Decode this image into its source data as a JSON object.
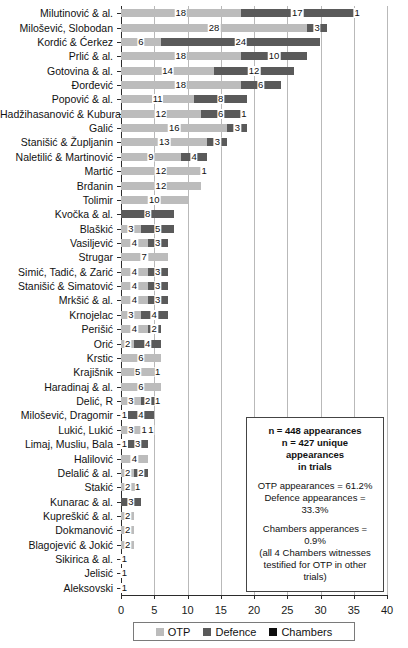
{
  "chart_data": {
    "type": "bar",
    "orientation": "horizontal",
    "stacked": true,
    "title": "",
    "xlabel": "",
    "ylabel": "",
    "xlim": [
      0,
      40
    ],
    "xticks": [
      0,
      5,
      10,
      15,
      20,
      25,
      30,
      35,
      40
    ],
    "grid": "vertical",
    "legend_position": "bottom",
    "series": [
      {
        "name": "OTP",
        "color": "#bcbcbc"
      },
      {
        "name": "Defence",
        "color": "#5a5a5a"
      },
      {
        "name": "Chambers",
        "color": "#0d0d0d"
      }
    ],
    "categories": [
      "Milutinović & al.",
      "Milošević, Slobodan",
      "Kordić & Ćerkez",
      "Prlić & al.",
      "Gotovina & al.",
      "Đorđević",
      "Popović & al.",
      "Hadžihasanović & Kubura",
      "Galić",
      "Stanišić & Župljanin",
      "Naletilić & Martinović",
      "Martić",
      "Brđanin",
      "Tolimir",
      "Kvočka & al.",
      "Blaškić",
      "Vasiljević",
      "Strugar",
      "Simić, Tadić, & Zarić",
      "Stanišić & Simatović",
      "Mrkšić & al.",
      "Krnojelac",
      "Perišić",
      "Orić",
      "Krstic",
      "Krajišnik",
      "Haradinaj & al.",
      "Delić, R",
      "Milošević, Dragomir",
      "Lukić, Lukić",
      "Limaj, Musliu, Bala",
      "Halilović",
      "Delalić & al.",
      "Stakić",
      "Kunarac & al.",
      "Kupreškić & al.",
      "Dokmanović",
      "Blagojević & Jokić",
      "Sikirica & al.",
      "Jelisić",
      "Aleksovski"
    ],
    "values": {
      "OTP": [
        18,
        28,
        6,
        18,
        14,
        18,
        11,
        12,
        16,
        13,
        9,
        12,
        12,
        10,
        0,
        3,
        4,
        7,
        4,
        4,
        4,
        3,
        4,
        2,
        6,
        5,
        6,
        3,
        1,
        3,
        1,
        4,
        2,
        2,
        0,
        2,
        2,
        2,
        1,
        1,
        1
      ],
      "Defence": [
        17,
        3,
        24,
        10,
        12,
        6,
        8,
        6,
        3,
        3,
        4,
        1,
        0,
        0,
        8,
        5,
        3,
        0,
        3,
        3,
        3,
        4,
        2,
        4,
        0,
        1,
        0,
        2,
        4,
        1,
        3,
        0,
        2,
        1,
        3,
        0,
        0,
        0,
        0,
        0,
        0
      ],
      "Chambers": [
        1,
        0,
        0,
        0,
        0,
        0,
        0,
        1,
        0,
        0,
        0,
        0,
        0,
        0,
        0,
        0,
        0,
        0,
        0,
        0,
        0,
        0,
        0,
        0,
        0,
        0,
        0,
        1,
        0,
        1,
        0,
        0,
        0,
        0,
        0,
        0,
        0,
        0,
        0,
        0,
        0
      ]
    }
  },
  "annotation": {
    "line1": "n = 448 appearances",
    "line2": "n = 427 unique appearances",
    "line3": "in trials",
    "line4": "OTP appearances = 61.2%",
    "line5": "Defence appearances = 33.3%",
    "line6": "Chambers apperances = 0.9%",
    "line7": "(all 4 Chambers witnesses",
    "line8": "testified for OTP in other trials)"
  },
  "legend": {
    "items": [
      {
        "label": "OTP",
        "key": "otp"
      },
      {
        "label": "Defence",
        "key": "def"
      },
      {
        "label": "Chambers",
        "key": "cham"
      }
    ]
  }
}
